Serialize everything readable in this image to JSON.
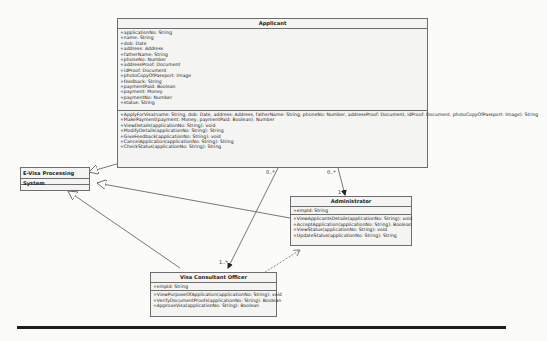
{
  "diagram": {
    "classes": {
      "applicant": {
        "name": "Applicant",
        "attributes": [
          "+applicationNo: String",
          "+name: String",
          "+dob: Date",
          "+address: Address",
          "+fatherName: String",
          "+phoneNo: Number",
          "+addressProof: Document",
          "+idProof: Document",
          "+photoCopyOfPassport: Image",
          "+feedback: String",
          "+paymentPaid: Boolean",
          "+payment: Money",
          "+paymentNo: Number",
          "+status: String"
        ],
        "operations": [
          "+ApplyForVisa(name: String, dob: Date, address: Address, fatherName: String, phoneNo: Number, addressProof: Document, idProof: Document, photoCopyOfPassport: Image): String",
          "+MakePayment(payment: Money, paymentPaid: Boolean): Number",
          "+ViewDetails(applicationNo: String): void",
          "+ModifyDetails(applicationNo: String): String",
          "+GiveFeedback(applicationNo: String): void",
          "+CancelApplication(applicationNo: String): String",
          "+CheckStatus(applicationNo: String): String"
        ]
      },
      "evisa": {
        "name": "E-Visa Processing System",
        "attributes": [],
        "operations": []
      },
      "administrator": {
        "name": "Administrator",
        "attributes": [
          "+empId: String"
        ],
        "operations": [
          "+ViewApplicantsDetails(applicationNo: String): void",
          "+AcceptApplication(applicationNo: String): Boolean",
          "+ViewStatus(applicationNo: String): void",
          "+UpdateStatus(applicationNo: String): String"
        ]
      },
      "officer": {
        "name": "Visa Consultant Officer",
        "attributes": [
          "+empId: String"
        ],
        "operations": [
          "+ViewPurposeOfApplication(applicationNo: String): void",
          "+VerifyDocumentProofs(applicationNo: String): Boolean",
          "+ApproveVisa(applicationNo: String): Boolean"
        ]
      }
    },
    "multiplicities": {
      "applicant_officer_src": "0..*",
      "applicant_admin_src": "0..*",
      "admin_end": "1",
      "officer_end": "1..*"
    },
    "relationships": [
      {
        "type": "generalization",
        "from": "Applicant",
        "to": "E-Visa Processing System"
      },
      {
        "type": "generalization",
        "from": "Administrator",
        "to": "E-Visa Processing System"
      },
      {
        "type": "generalization",
        "from": "Visa Consultant Officer",
        "to": "E-Visa Processing System"
      },
      {
        "type": "association",
        "from": "Applicant",
        "to": "Administrator"
      },
      {
        "type": "association",
        "from": "Applicant",
        "to": "Visa Consultant Officer"
      },
      {
        "type": "dependency",
        "from": "Visa Consultant Officer",
        "to": "Administrator"
      }
    ],
    "colors": {
      "line": "#555555",
      "box_fill": "#f4f4f2",
      "border": "#6e6e6e"
    }
  }
}
